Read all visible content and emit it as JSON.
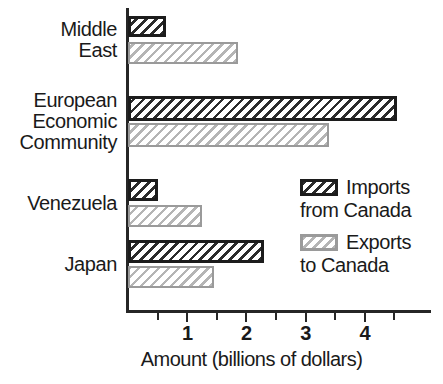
{
  "chart_data": {
    "type": "bar",
    "orientation": "horizontal",
    "title": "",
    "xlabel": "Amount (billions of dollars)",
    "ylabel": "",
    "xlim": [
      0,
      4.8
    ],
    "xticks": [
      1,
      2,
      3,
      4
    ],
    "xtick_labels": [
      "1",
      "2",
      "3",
      "4"
    ],
    "minor_xticks": [
      0.5,
      1.5,
      2.5,
      3.5,
      4.5
    ],
    "grid": false,
    "legend_position": "center-right",
    "categories": [
      "Middle\nEast",
      "European\nEconomic\nCommunity",
      "Venezuela",
      "Japan"
    ],
    "series": [
      {
        "name": "Imports from Canada",
        "legend_label_line1": "Imports",
        "legend_label_line2": "from Canada",
        "color": "#1c1c1c",
        "pattern": "diagonal-hatch-dark",
        "values": [
          0.65,
          4.55,
          0.5,
          2.3
        ]
      },
      {
        "name": "Exports to Canada",
        "legend_label_line1": "Exports",
        "legend_label_line2": "to Canada",
        "color": "#9a9a9a",
        "pattern": "diagonal-hatch-light",
        "values": [
          1.85,
          3.4,
          1.25,
          1.45
        ]
      }
    ]
  },
  "axis": {
    "x_title": "Amount (billions of dollars)"
  }
}
